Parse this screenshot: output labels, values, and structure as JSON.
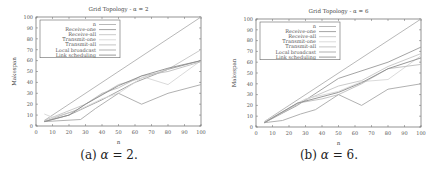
{
  "chart_data": [
    {
      "type": "line",
      "title": "Grid Topology - α = 2",
      "xlabel": "n",
      "ylabel": "Makespan",
      "xlim": [
        0,
        100
      ],
      "ylim": [
        0,
        100
      ],
      "xticks": [
        0,
        10,
        20,
        30,
        40,
        50,
        60,
        70,
        80,
        90,
        100
      ],
      "yticks": [
        0,
        10,
        20,
        30,
        40,
        50,
        60,
        70,
        80,
        90,
        100
      ],
      "grid": false,
      "legend_position": "upper left",
      "caption": "(a) α = 2.",
      "series": [
        {
          "name": "n",
          "x": [
            5,
            100
          ],
          "y": [
            5,
            100
          ],
          "color": "#b0b0b0"
        },
        {
          "name": "Receive-one",
          "x": [
            5,
            20,
            40,
            60,
            80,
            100
          ],
          "y": [
            4,
            10,
            24,
            40,
            52,
            60
          ],
          "color": "#9a9a9a"
        },
        {
          "name": "Receive-all",
          "x": [
            5,
            30,
            50,
            64,
            80,
            100
          ],
          "y": [
            5,
            20,
            38,
            44,
            52,
            70
          ],
          "color": "#c4c4c4"
        },
        {
          "name": "Transmit-one",
          "x": [
            5,
            10,
            25,
            40,
            50,
            65,
            80,
            100
          ],
          "y": [
            11,
            8,
            14,
            25,
            30,
            45,
            38,
            60
          ],
          "color": "#d6d6d6"
        },
        {
          "name": "Transmit-all",
          "x": [
            5,
            25,
            40,
            50,
            64,
            80,
            100
          ],
          "y": [
            4,
            15,
            30,
            35,
            46,
            50,
            59
          ],
          "color": "#bdbdbd"
        },
        {
          "name": "Local broadcast",
          "x": [
            5,
            27,
            36,
            50,
            64,
            80,
            100
          ],
          "y": [
            4,
            6,
            16,
            30,
            20,
            30,
            38
          ],
          "color": "#a8a8a8"
        },
        {
          "name": "Link scheduling",
          "x": [
            5,
            20,
            30,
            50,
            64,
            80,
            100
          ],
          "y": [
            4,
            10,
            20,
            37,
            46,
            53,
            60
          ],
          "color": "#8c8c8c"
        }
      ]
    },
    {
      "type": "line",
      "title": "Grid Topology - α = 6",
      "xlabel": "n",
      "ylabel": "Makespan",
      "xlim": [
        0,
        100
      ],
      "ylim": [
        0,
        100
      ],
      "xticks": [
        0,
        10,
        20,
        30,
        40,
        50,
        60,
        70,
        80,
        90,
        100
      ],
      "yticks": [
        0,
        10,
        20,
        30,
        40,
        50,
        60,
        70,
        80,
        90,
        100
      ],
      "grid": false,
      "legend_position": "upper left",
      "caption": "(b) α = 6.",
      "series": [
        {
          "name": "n",
          "x": [
            5,
            100
          ],
          "y": [
            5,
            100
          ],
          "color": "#b0b0b0"
        },
        {
          "name": "Receive-one",
          "x": [
            5,
            25,
            50,
            80,
            100
          ],
          "y": [
            4,
            20,
            45,
            60,
            74
          ],
          "color": "#9a9a9a"
        },
        {
          "name": "Receive-all",
          "x": [
            5,
            30,
            50,
            64,
            80,
            100
          ],
          "y": [
            4,
            25,
            38,
            43,
            56,
            68
          ],
          "color": "#c4c4c4"
        },
        {
          "name": "Transmit-one",
          "x": [
            5,
            30,
            50,
            64,
            80,
            100
          ],
          "y": [
            5,
            26,
            33,
            42,
            44,
            66
          ],
          "color": "#d6d6d6"
        },
        {
          "name": "Transmit-all",
          "x": [
            5,
            25,
            40,
            50,
            64,
            80,
            100
          ],
          "y": [
            4,
            22,
            26,
            30,
            40,
            54,
            58
          ],
          "color": "#bdbdbd"
        },
        {
          "name": "Local broadcast",
          "x": [
            5,
            16,
            27,
            36,
            50,
            64,
            80,
            100
          ],
          "y": [
            4,
            6,
            12,
            16,
            30,
            20,
            35,
            40
          ],
          "color": "#a8a8a8"
        },
        {
          "name": "Link scheduling",
          "x": [
            5,
            25,
            50,
            64,
            80,
            100
          ],
          "y": [
            4,
            22,
            32,
            41,
            54,
            64
          ],
          "color": "#8c8c8c"
        }
      ]
    }
  ],
  "captions": {
    "a": {
      "prefix": "(a) ",
      "symbol": "α",
      "rest": " = 2."
    },
    "b": {
      "prefix": "(b) ",
      "symbol": "α",
      "rest": " = 6."
    }
  }
}
